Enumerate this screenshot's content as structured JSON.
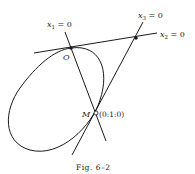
{
  "figure": {
    "caption": "Fig. 6–2",
    "caption_prefix": "Fig.",
    "caption_number": "6–2"
  },
  "labels": {
    "line_x1": {
      "var": "x",
      "sub": "1",
      "eq": " = 0"
    },
    "line_x2": {
      "var": "x",
      "sub": "2",
      "eq": " = 0"
    },
    "line_x3": {
      "var": "x",
      "sub": "3",
      "eq": " = 0"
    },
    "point_O": "O",
    "point_M": "M",
    "point_M_coords": "(0:1:0)"
  },
  "colors": {
    "ink": "#1a1a1a",
    "background": "#ffffff"
  }
}
